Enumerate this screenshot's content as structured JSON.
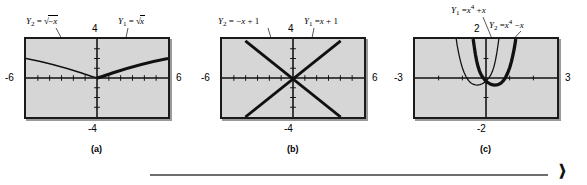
{
  "figure": {
    "panels": [
      {
        "id": "a",
        "caption": "(a)",
        "axis": {
          "left": "-6",
          "right": "6",
          "top": "4",
          "bottom": "-4"
        },
        "curves": [
          {
            "name": "Y2",
            "sub": "2",
            "expr_prefix": "√",
            "expr": "-x",
            "label_text": "Y2 = √(-x)",
            "style": "thin"
          },
          {
            "name": "Y1",
            "sub": "1",
            "expr_prefix": "√",
            "expr": "x",
            "label_text": "Y1 = √x",
            "style": "bold"
          }
        ]
      },
      {
        "id": "b",
        "caption": "(b)",
        "axis": {
          "left": "-6",
          "right": "6",
          "top": "4",
          "bottom": "-4"
        },
        "curves": [
          {
            "name": "Y2",
            "sub": "2",
            "expr": "-x + 1",
            "label_text": "Y2 = -x + 1",
            "style": "bold"
          },
          {
            "name": "Y1",
            "sub": "1",
            "expr": "x + 1",
            "label_text": "Y1 = x + 1",
            "style": "bold"
          }
        ]
      },
      {
        "id": "c",
        "caption": "(c)",
        "axis": {
          "left": "-3",
          "right": "3",
          "top": "2",
          "bottom": "-2"
        },
        "curves": [
          {
            "name": "Y1",
            "sub": "1",
            "expr": "x^4 + x",
            "label_text": "Y1 = x⁴ + x",
            "style": "bold"
          },
          {
            "name": "Y2",
            "sub": "2",
            "expr": "x^4 - x",
            "label_text": "Y2 = x⁴ - x",
            "style": "thin"
          }
        ]
      }
    ]
  },
  "glyphs": {
    "Y": "Y",
    "equals": "=",
    "minus": "−",
    "plus": "+",
    "x": "x",
    "one": "1",
    "four_exp": "4",
    "radical": "√",
    "end_marker": "❱"
  },
  "colors": {
    "plot_background": "#d6d6d6",
    "frame": "#1a1a1a",
    "curve": "#111111",
    "rule": "#6e6e6e",
    "page_background": "#ffffff"
  }
}
